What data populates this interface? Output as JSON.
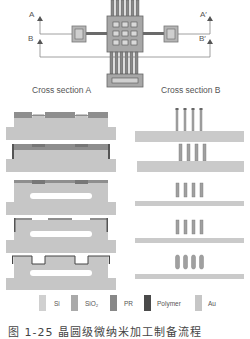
{
  "top_view": {
    "labels": {
      "A": "A",
      "A_prime": "A′",
      "B": "B",
      "B_prime": "B′"
    }
  },
  "section_titles": {
    "left": "Cross section A",
    "right": "Cross section B"
  },
  "steps": 5,
  "legend": [
    {
      "label": "Si",
      "color": "#cfcfcf"
    },
    {
      "label": "SiO₂",
      "color": "#a9a9a9"
    },
    {
      "label": "PR",
      "color": "#8a8a8a"
    },
    {
      "label": "Polymer",
      "color": "#4a4a4a"
    },
    {
      "label": "Au",
      "color": "#c4c4c4"
    }
  ],
  "colors": {
    "si": "#c8c8c8",
    "sio2": "#9a9a9a",
    "pr": "#7f7f7f",
    "polymer": "#555555",
    "au": "#bdbdbd",
    "line": "#777777"
  },
  "caption": "图 1-25 晶圆级微纳米加工制备流程"
}
